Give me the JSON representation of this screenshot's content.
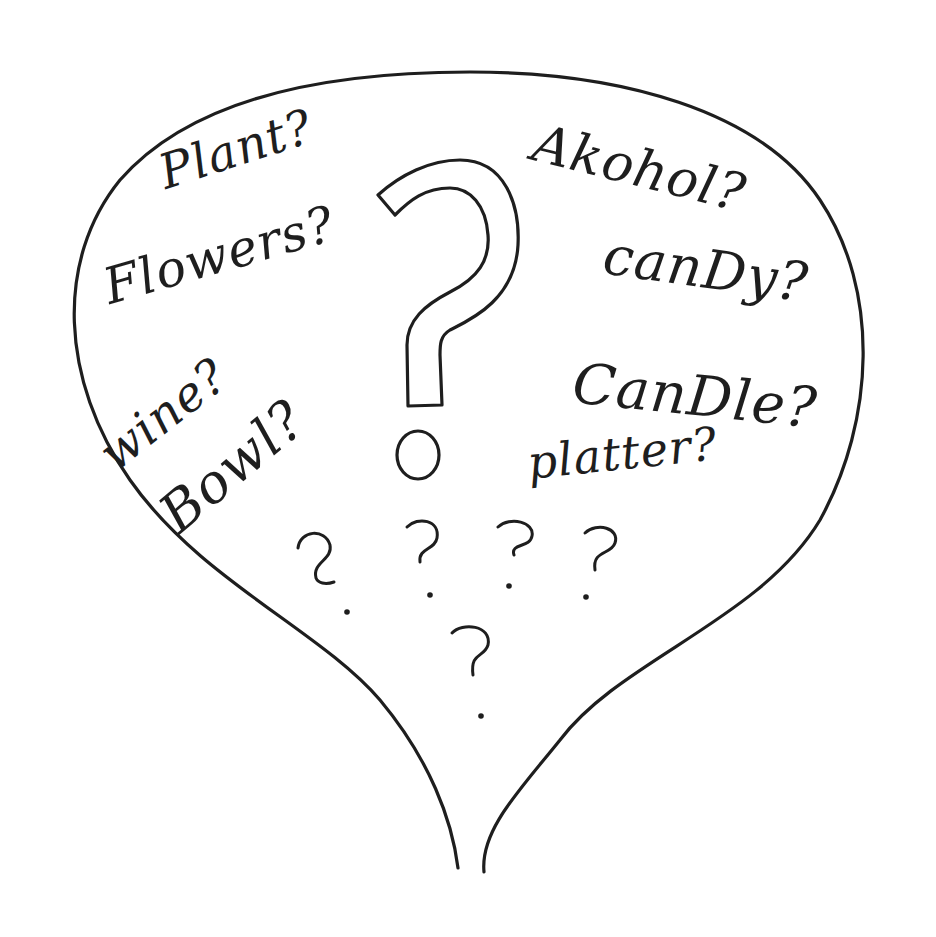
{
  "illustration": {
    "description": "Hand-drawn speech bubble filled with gift ideas and question marks",
    "ink_color": "#1e1e1e",
    "background_color": "#ffffff",
    "words": [
      {
        "id": "plant",
        "text": "Plant?"
      },
      {
        "id": "flowers",
        "text": "Flowers?"
      },
      {
        "id": "wine",
        "text": "wine?"
      },
      {
        "id": "bowl",
        "text": "Bowl?"
      },
      {
        "id": "alcohol",
        "text": "Akohol?"
      },
      {
        "id": "candy",
        "text": "canDy?"
      },
      {
        "id": "candle",
        "text": "CanDle?"
      },
      {
        "id": "platter",
        "text": "platter?"
      }
    ],
    "center_symbol": "?",
    "small_marks": [
      "?",
      "?",
      "?",
      "?",
      "?"
    ]
  }
}
